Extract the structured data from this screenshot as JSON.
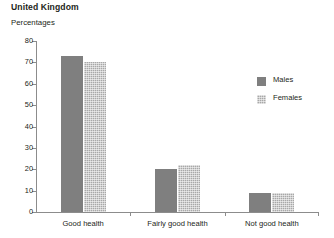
{
  "header": {
    "title": "United Kingdom",
    "subtitle": "Percentages"
  },
  "chart_data": {
    "type": "bar",
    "title": "United Kingdom",
    "subtitle": "Percentages",
    "xlabel": "",
    "ylabel": "Percentages",
    "ylim": [
      0,
      80
    ],
    "yticks": [
      0,
      10,
      20,
      30,
      40,
      50,
      60,
      70,
      80
    ],
    "ytick_labels": [
      "0",
      "10",
      "20",
      "30",
      "40",
      "50",
      "60",
      "70",
      "80"
    ],
    "grid": false,
    "legend_position": "right",
    "categories": [
      "Good health",
      "Fairly good health",
      "Not good health"
    ],
    "series": [
      {
        "name": "Males",
        "color": "#7f7f7f",
        "pattern": "solid",
        "values": [
          73,
          20,
          9
        ]
      },
      {
        "name": "Females",
        "color": "#a8a8a8",
        "pattern": "cross-hatch",
        "values": [
          70,
          22,
          9
        ]
      }
    ]
  },
  "legend": {
    "items": [
      {
        "label": "Males"
      },
      {
        "label": "Females"
      }
    ]
  },
  "axis": {
    "ytick_labels": [
      "80",
      "70",
      "60",
      "50",
      "40",
      "30",
      "20",
      "10",
      "0"
    ],
    "category_labels": [
      "Good health",
      "Fairly good health",
      "Not good health"
    ]
  }
}
